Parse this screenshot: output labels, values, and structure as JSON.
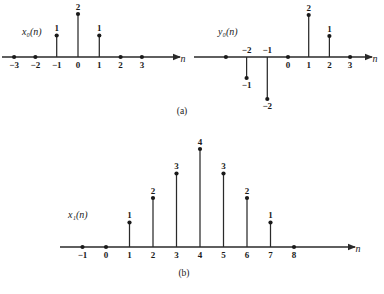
{
  "figure": {
    "background": "#ffffff",
    "stroke_color": "#2a2a2a",
    "dot_color": "#1a1a1a",
    "text_color": "#1a1a1a"
  },
  "captions": {
    "a": "(a)",
    "b": "(b)"
  },
  "axis_name": "n",
  "labels": {
    "x0": "x₀(n)",
    "y0": "y₀(n)",
    "x1": "x₁(n)"
  },
  "chart_data": [
    {
      "id": "x0",
      "type": "scatter",
      "subplot": "(a)-left",
      "title": "x₀(n)",
      "xlabel": "n",
      "ylabel": "",
      "grid": false,
      "legend": "none",
      "xlim": [
        -3.6,
        4.6
      ],
      "ylim": [
        -0.35,
        2.6
      ],
      "x": [
        -3,
        -2,
        -1,
        0,
        1,
        2,
        3
      ],
      "values": [
        0,
        0,
        1,
        2,
        1,
        0,
        0
      ],
      "xticklabels": [
        "−3",
        "−2",
        "−1",
        "0",
        "1",
        "2",
        "3"
      ],
      "point_labels": [
        "",
        "",
        "1",
        "2",
        "1",
        "",
        ""
      ]
    },
    {
      "id": "y0",
      "type": "scatter",
      "subplot": "(a)-right",
      "title": "y₀(n)",
      "xlabel": "n",
      "ylabel": "",
      "grid": false,
      "legend": "none",
      "xlim": [
        -3.6,
        4.6
      ],
      "ylim": [
        -2.4,
        2.6
      ],
      "x": [
        -3,
        -2,
        -1,
        0,
        1,
        2,
        3
      ],
      "values": [
        0,
        -1,
        -2,
        0,
        2,
        1,
        0
      ],
      "xticklabels": [
        "",
        "−2",
        "−1",
        "0",
        "1",
        "2",
        "3"
      ],
      "point_labels": [
        "",
        "−1",
        "−2",
        "",
        "2",
        "1",
        ""
      ]
    },
    {
      "id": "x1",
      "type": "scatter",
      "subplot": "(b)",
      "title": "x₁(n)",
      "xlabel": "n",
      "ylabel": "",
      "grid": false,
      "legend": "none",
      "xlim": [
        -1.6,
        11.0
      ],
      "ylim": [
        -0.35,
        4.6
      ],
      "x": [
        -1,
        0,
        1,
        2,
        3,
        4,
        5,
        6,
        7,
        8
      ],
      "values": [
        0,
        0,
        1,
        2,
        3,
        4,
        3,
        2,
        1,
        0
      ],
      "xticklabels": [
        "−1",
        "0",
        "1",
        "2",
        "3",
        "4",
        "5",
        "6",
        "7",
        "8"
      ],
      "point_labels": [
        "",
        "",
        "1",
        "2",
        "3",
        "4",
        "3",
        "2",
        "1",
        ""
      ]
    }
  ]
}
